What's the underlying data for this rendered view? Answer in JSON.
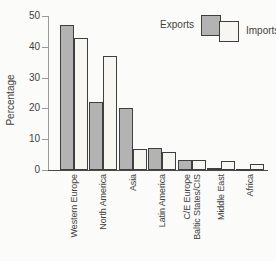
{
  "chart_data": {
    "type": "bar",
    "title": "",
    "ylabel": "Percentage",
    "xlabel": "",
    "ylim": [
      0,
      50
    ],
    "yticks": [
      0,
      10,
      20,
      30,
      40,
      50
    ],
    "grid": false,
    "legend_position": "top-right",
    "categories": [
      "Western Europe",
      "North America",
      "Asia",
      "Latin America",
      "C/E Europe\nBaltic States/CIS",
      "Middle East",
      "Africa"
    ],
    "series": [
      {
        "name": "Exports",
        "color": "#b3b3b3",
        "values": [
          47,
          22,
          20,
          7.2,
          3.2,
          0.5,
          0.4
        ]
      },
      {
        "name": "Imports",
        "color": "#f7f6f1",
        "values": [
          43,
          37,
          6.8,
          5.8,
          3.4,
          2.8,
          2
        ]
      }
    ],
    "bar_border_color": "#3f3f3f",
    "axis_color": "#9a9a9a"
  }
}
